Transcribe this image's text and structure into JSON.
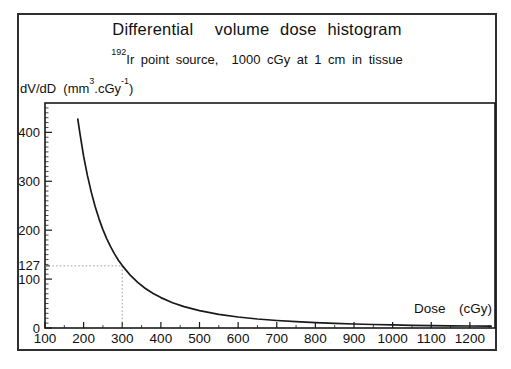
{
  "header": {
    "title": "Differential  volume dose histogram",
    "isotope_superscript": "192",
    "subtitle_rest": "Ir point source,  1000 cGy at 1 cm in tissue"
  },
  "axis_labels": {
    "y_prefix": "dV/dD  (mm",
    "y_sup1": "3",
    "y_mid": ".cGy",
    "y_sup2": "-1",
    "y_suffix": ")",
    "x": "Dose  (cGy)"
  },
  "chart_data": {
    "type": "line",
    "title": "Differential volume dose histogram",
    "subtitle": "192Ir point source, 1000 cGy at 1 cm in tissue",
    "xlabel": "Dose (cGy)",
    "ylabel": "dV/dD (mm3.cGy-1)",
    "xlim": [
      100,
      1265
    ],
    "ylim": [
      0,
      460
    ],
    "x_ticks": [
      100,
      200,
      300,
      400,
      500,
      600,
      700,
      800,
      900,
      1000,
      1100,
      1200
    ],
    "x_minor_step": 50,
    "y_ticks": [
      0,
      100,
      200,
      300,
      400
    ],
    "y_minor_step": 10,
    "grid": false,
    "legend": "none",
    "reference_point": {
      "dose": 300,
      "value": 127,
      "label": "127"
    },
    "line_color": "#191919",
    "guide_color": "#8f8f8f",
    "series": [
      {
        "name": "dV/dD",
        "points": [
          [
            185,
            426.8
          ],
          [
            190,
            399.3
          ],
          [
            200,
            351.2
          ],
          [
            210,
            310.9
          ],
          [
            220,
            276.8
          ],
          [
            230,
            247.7
          ],
          [
            240,
            222.7
          ],
          [
            250,
            201.1
          ],
          [
            260,
            182.3
          ],
          [
            270,
            165.9
          ],
          [
            280,
            151.5
          ],
          [
            290,
            138.7
          ],
          [
            300,
            127.5
          ],
          [
            320,
            108.5
          ],
          [
            340,
            93.2
          ],
          [
            360,
            80.8
          ],
          [
            380,
            70.6
          ],
          [
            400,
            62.1
          ],
          [
            430,
            51.8
          ],
          [
            460,
            43.8
          ],
          [
            500,
            35.5
          ],
          [
            550,
            28.0
          ],
          [
            600,
            22.5
          ],
          [
            650,
            18.4
          ],
          [
            700,
            15.3
          ],
          [
            750,
            12.9
          ],
          [
            800,
            11.0
          ],
          [
            850,
            9.4
          ],
          [
            900,
            8.2
          ],
          [
            950,
            7.1
          ],
          [
            1000,
            6.3
          ],
          [
            1050,
            5.6
          ],
          [
            1100,
            5.0
          ],
          [
            1150,
            4.4
          ],
          [
            1200,
            4.0
          ],
          [
            1255,
            3.6
          ]
        ]
      }
    ]
  }
}
